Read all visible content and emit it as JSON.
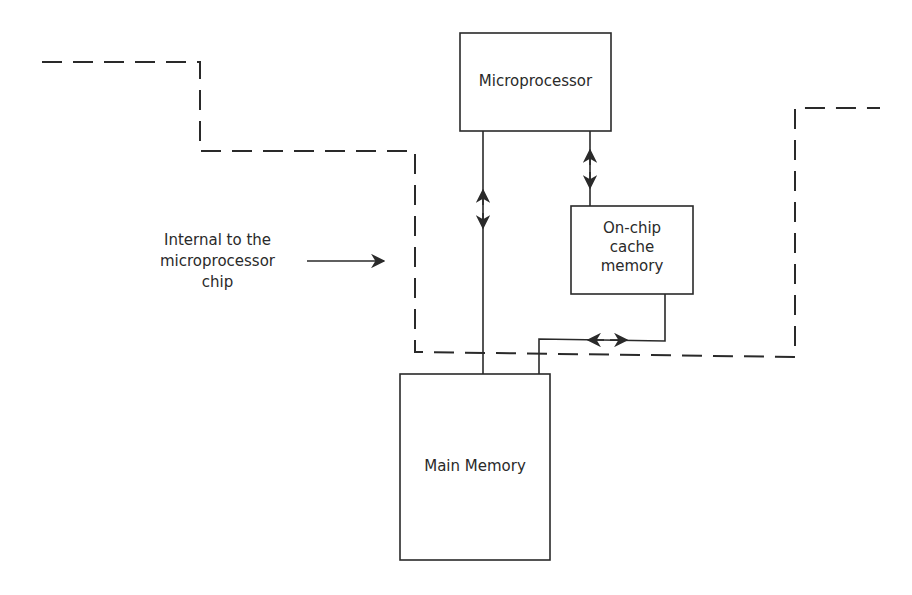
{
  "diagram": {
    "type": "block-diagram",
    "colors": {
      "stroke": "#2a2a2a",
      "background": "#ffffff"
    },
    "nodes": {
      "microprocessor": {
        "label": "Microprocessor"
      },
      "cache": {
        "label_line1": "On-chip",
        "label_line2": "cache",
        "label_line3": "memory"
      },
      "main_memory": {
        "label": "Main Memory"
      }
    },
    "annotation": {
      "line1": "Internal to the",
      "line2": "microprocessor",
      "line3": "chip"
    },
    "edges": [
      {
        "from": "microprocessor",
        "to": "main_memory",
        "bidirectional": true
      },
      {
        "from": "microprocessor",
        "to": "cache",
        "bidirectional": true
      },
      {
        "from": "cache",
        "to": "main_memory",
        "bidirectional": true
      }
    ],
    "boundary": {
      "style": "dashed",
      "meaning": "chip boundary"
    }
  }
}
